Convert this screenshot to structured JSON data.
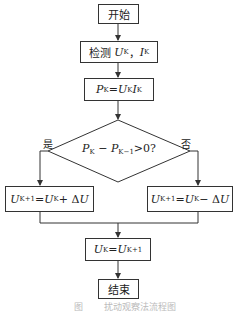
{
  "diagram": {
    "type": "flowchart",
    "nodes": {
      "start": {
        "label": "开始"
      },
      "measure": {
        "prefix": "检测 ",
        "u": "U",
        "u_sub": "K",
        "sep": "，",
        "i": "I",
        "i_sub": "K"
      },
      "power": {
        "p": "P",
        "p_sub": "K",
        "eq": " =",
        "u": "U",
        "u_sub": "K",
        "i": "I",
        "i_sub": "K"
      },
      "decision": {
        "p1": "P",
        "p1_sub": "K",
        "minus": " − ",
        "p2": "P",
        "p2_sub": "K−1",
        "cond": ">0?"
      },
      "increase": {
        "lhs": "U",
        "lhs_sub": "K+1",
        "eq": " =",
        "u": "U",
        "u_sub": "K",
        "op": " + Δ",
        "d": "U"
      },
      "decrease": {
        "lhs": "U",
        "lhs_sub": "K+1",
        "eq": " =",
        "u": "U",
        "u_sub": "K",
        "op": " − Δ",
        "d": "U"
      },
      "update": {
        "lhs": "U",
        "lhs_sub": "K",
        "eq": " =",
        "u": "U",
        "u_sub": "K+1"
      },
      "end": {
        "label": "结束"
      }
    },
    "branch_labels": {
      "yes": "是",
      "no": "否"
    },
    "caption": "图 　　扰动观察法流程图"
  }
}
